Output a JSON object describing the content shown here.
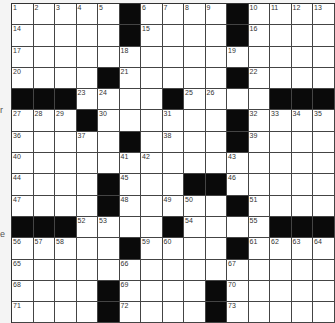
{
  "puzzle": {
    "type": "crossword",
    "rows": 15,
    "cols": 15,
    "layout": [
      ".....#....#....",
      ".....#....#....",
      "...............",
      "....#.....#....",
      "###....#....###",
      "...#......#....",
      ".....#....#....",
      "...............",
      "....#...##.....",
      "....#.....#....",
      "###....#....###",
      ".....#....#....",
      "...............",
      "....#....#.....",
      "....#....#....."
    ],
    "numbers": [
      {
        "r": 0,
        "c": 0,
        "n": "1"
      },
      {
        "r": 0,
        "c": 1,
        "n": "2"
      },
      {
        "r": 0,
        "c": 2,
        "n": "3"
      },
      {
        "r": 0,
        "c": 3,
        "n": "4"
      },
      {
        "r": 0,
        "c": 4,
        "n": "5"
      },
      {
        "r": 0,
        "c": 6,
        "n": "6"
      },
      {
        "r": 0,
        "c": 7,
        "n": "7"
      },
      {
        "r": 0,
        "c": 8,
        "n": "8"
      },
      {
        "r": 0,
        "c": 9,
        "n": "9"
      },
      {
        "r": 0,
        "c": 11,
        "n": "10"
      },
      {
        "r": 0,
        "c": 12,
        "n": "11"
      },
      {
        "r": 0,
        "c": 13,
        "n": "12"
      },
      {
        "r": 0,
        "c": 14,
        "n": "13"
      },
      {
        "r": 1,
        "c": 0,
        "n": "14"
      },
      {
        "r": 1,
        "c": 6,
        "n": "15"
      },
      {
        "r": 1,
        "c": 11,
        "n": "16"
      },
      {
        "r": 2,
        "c": 0,
        "n": "17"
      },
      {
        "r": 2,
        "c": 5,
        "n": "18"
      },
      {
        "r": 2,
        "c": 10,
        "n": "19"
      },
      {
        "r": 3,
        "c": 0,
        "n": "20"
      },
      {
        "r": 3,
        "c": 5,
        "n": "21"
      },
      {
        "r": 3,
        "c": 11,
        "n": "22"
      },
      {
        "r": 4,
        "c": 3,
        "n": "23"
      },
      {
        "r": 4,
        "c": 4,
        "n": "24"
      },
      {
        "r": 4,
        "c": 8,
        "n": "25"
      },
      {
        "r": 4,
        "c": 9,
        "n": "26"
      },
      {
        "r": 5,
        "c": 0,
        "n": "27"
      },
      {
        "r": 5,
        "c": 1,
        "n": "28"
      },
      {
        "r": 5,
        "c": 2,
        "n": "29"
      },
      {
        "r": 5,
        "c": 4,
        "n": "30"
      },
      {
        "r": 5,
        "c": 7,
        "n": "31"
      },
      {
        "r": 5,
        "c": 11,
        "n": "32"
      },
      {
        "r": 5,
        "c": 12,
        "n": "33"
      },
      {
        "r": 5,
        "c": 13,
        "n": "34"
      },
      {
        "r": 5,
        "c": 14,
        "n": "35"
      },
      {
        "r": 6,
        "c": 0,
        "n": "36"
      },
      {
        "r": 6,
        "c": 3,
        "n": "37"
      },
      {
        "r": 6,
        "c": 7,
        "n": "38"
      },
      {
        "r": 6,
        "c": 11,
        "n": "39"
      },
      {
        "r": 7,
        "c": 0,
        "n": "40"
      },
      {
        "r": 7,
        "c": 5,
        "n": "41"
      },
      {
        "r": 7,
        "c": 6,
        "n": "42"
      },
      {
        "r": 7,
        "c": 10,
        "n": "43"
      },
      {
        "r": 8,
        "c": 0,
        "n": "44"
      },
      {
        "r": 8,
        "c": 5,
        "n": "45"
      },
      {
        "r": 8,
        "c": 10,
        "n": "46"
      },
      {
        "r": 9,
        "c": 0,
        "n": "47"
      },
      {
        "r": 9,
        "c": 5,
        "n": "48"
      },
      {
        "r": 9,
        "c": 7,
        "n": "49"
      },
      {
        "r": 9,
        "c": 8,
        "n": "50"
      },
      {
        "r": 9,
        "c": 11,
        "n": "51"
      },
      {
        "r": 10,
        "c": 3,
        "n": "52"
      },
      {
        "r": 10,
        "c": 4,
        "n": "53"
      },
      {
        "r": 10,
        "c": 8,
        "n": "54"
      },
      {
        "r": 10,
        "c": 11,
        "n": "55"
      },
      {
        "r": 11,
        "c": 0,
        "n": "56"
      },
      {
        "r": 11,
        "c": 1,
        "n": "57"
      },
      {
        "r": 11,
        "c": 2,
        "n": "58"
      },
      {
        "r": 11,
        "c": 6,
        "n": "59"
      },
      {
        "r": 11,
        "c": 7,
        "n": "60"
      },
      {
        "r": 11,
        "c": 11,
        "n": "61"
      },
      {
        "r": 11,
        "c": 12,
        "n": "62"
      },
      {
        "r": 11,
        "c": 13,
        "n": "63"
      },
      {
        "r": 11,
        "c": 14,
        "n": "64"
      },
      {
        "r": 12,
        "c": 0,
        "n": "65"
      },
      {
        "r": 12,
        "c": 5,
        "n": "66"
      },
      {
        "r": 12,
        "c": 10,
        "n": "67"
      },
      {
        "r": 13,
        "c": 0,
        "n": "68"
      },
      {
        "r": 13,
        "c": 5,
        "n": "69"
      },
      {
        "r": 13,
        "c": 10,
        "n": "70"
      },
      {
        "r": 14,
        "c": 0,
        "n": "71"
      },
      {
        "r": 14,
        "c": 5,
        "n": "72"
      },
      {
        "r": 14,
        "c": 10,
        "n": "73"
      }
    ]
  },
  "edge_fragments": {
    "left_row6": "r",
    "left_row11": "e"
  },
  "colors": {
    "black_cell": "#0a0a0a",
    "white_cell": "#ffffff",
    "grid_line": "#444444"
  }
}
